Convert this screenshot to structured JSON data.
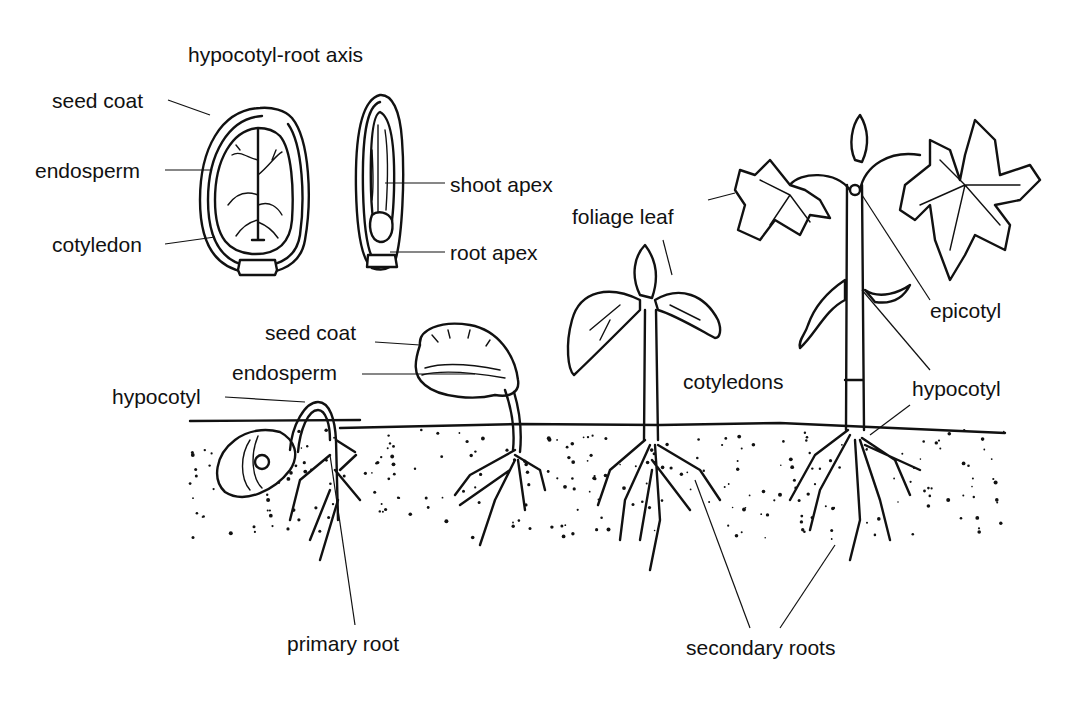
{
  "diagram": {
    "labels": {
      "hypocotyl_root_axis": "hypocotyl-root axis",
      "seed_coat_top": "seed coat",
      "endosperm_top": "endosperm",
      "cotyledon": "cotyledon",
      "shoot_apex": "shoot apex",
      "root_apex": "root apex",
      "seed_coat_mid": "seed coat",
      "endosperm_mid": "endosperm",
      "hypocotyl_left": "hypocotyl",
      "foliage_leaf": "foliage leaf",
      "cotyledons": "cotyledons",
      "epicotyl": "epicotyl",
      "hypocotyl_right": "hypocotyl",
      "primary_root": "primary root",
      "secondary_roots": "secondary roots"
    },
    "stages": [
      "seed-longitudinal-section-face",
      "seed-longitudinal-section-side",
      "germinating-seed-hook",
      "seedling-with-seed-coat",
      "seedling-with-cotyledons",
      "young-plant-with-foliage-leaves"
    ]
  }
}
